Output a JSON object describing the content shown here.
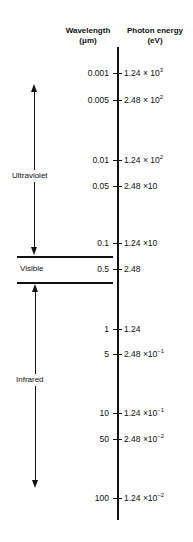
{
  "headers": {
    "wavelength_line1": "Wavelength",
    "wavelength_line2": "(μm)",
    "energy_line1": "Photon energy",
    "energy_line2": "(eV)"
  },
  "regions": {
    "ultraviolet": "Ultraviolet",
    "visible": "Visible",
    "infrared": "Infrared"
  },
  "rows": [
    {
      "wavelength": "0.001",
      "energy_mantissa": "1.24 × 10",
      "energy_exp": "3"
    },
    {
      "wavelength": "0.005",
      "energy_mantissa": "2.48 × 10",
      "energy_exp": "2"
    },
    {
      "wavelength": "0.01",
      "energy_mantissa": "1.24 × 10",
      "energy_exp": "2"
    },
    {
      "wavelength": "0.05",
      "energy_mantissa": "2.48 ×10",
      "energy_exp": ""
    },
    {
      "wavelength": "0.1",
      "energy_mantissa": "1.24 ×10",
      "energy_exp": ""
    },
    {
      "wavelength": "0.5",
      "energy_mantissa": "2.48",
      "energy_exp": ""
    },
    {
      "wavelength": "1",
      "energy_mantissa": "1.24",
      "energy_exp": ""
    },
    {
      "wavelength": "5",
      "energy_mantissa": "2.48 ×10",
      "energy_exp": "−1"
    },
    {
      "wavelength": "10",
      "energy_mantissa": "1.24 ×10",
      "energy_exp": "−1"
    },
    {
      "wavelength": "50",
      "energy_mantissa": "2.48 ×10",
      "energy_exp": "−2"
    },
    {
      "wavelength": "100",
      "energy_mantissa": "1.24 ×10",
      "energy_exp": "−2"
    }
  ]
}
